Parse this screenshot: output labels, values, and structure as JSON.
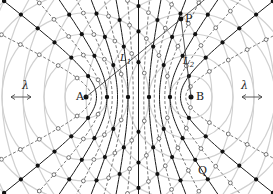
{
  "diagram": {
    "sources": [
      {
        "label": "A",
        "x": 86,
        "y": 97
      },
      {
        "label": "B",
        "x": 191,
        "y": 97
      }
    ],
    "points": [
      {
        "label": "P",
        "x": 181,
        "y": 19
      },
      {
        "label": "Q",
        "x": 201,
        "y": 170
      }
    ],
    "lines": [
      {
        "label": "L1",
        "sub": "1",
        "x": 121,
        "y": 59
      },
      {
        "label": "L2",
        "sub": "2",
        "x": 190,
        "y": 60
      }
    ],
    "wavelength_label": "λ",
    "wavelength_markers": [
      {
        "x": 21,
        "y": 97
      },
      {
        "x": 252,
        "y": 97
      }
    ],
    "colors": {
      "circle": "#d0d0d0",
      "antinodal": "#1a1a1a",
      "nodal": "#555555",
      "dot_fill": "#111111",
      "open_fill": "#ffffff"
    },
    "wavelength_px": 21,
    "legend": {
      "solid_lines": "antinodal lines (filled dots)",
      "dashed_lines": "nodal lines (open dots)"
    }
  }
}
